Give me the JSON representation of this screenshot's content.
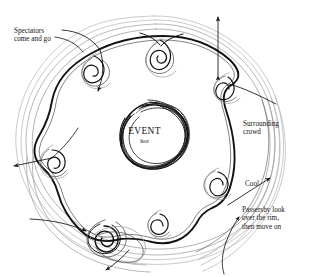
{
  "diagram": {
    "title_center": "EVENT",
    "subtitle_center": "hot",
    "annotations": [
      {
        "id": "spectators",
        "text": "Spectators\ncome and go",
        "x": 14,
        "y": 27
      },
      {
        "id": "surrounding_crowd",
        "text": "Surrounding\ncrowd",
        "x": 243,
        "y": 120
      },
      {
        "id": "cool",
        "text": "Cool",
        "x": 245,
        "y": 180
      },
      {
        "id": "passersby",
        "text": "Passersby look\nover the rim,\nthen move on",
        "x": 242,
        "y": 206
      }
    ],
    "colors": {
      "background": "#ffffff",
      "ink_dark": "#111111",
      "ink_mid": "#4a4a4a",
      "ink_light": "#8c8c8c"
    },
    "structure": {
      "center_blob": "scribbled dense ring labelled EVENT hot",
      "inner_ring": "heavy hand-drawn closed loop with six spiral clusters on it",
      "outer_rings": "three to four faint concentric hand-drawn contour lines",
      "spiral_clusters": 6,
      "arrows_outward": 5,
      "arrow_double_headed": 1
    }
  }
}
